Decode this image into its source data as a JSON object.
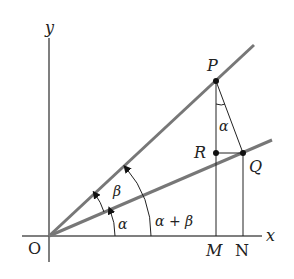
{
  "diagram": {
    "colors": {
      "axis": "#555555",
      "ray": "#777777",
      "construction": "#222222",
      "point": "#111111",
      "text": "#222222"
    },
    "axes": {
      "x_label": "x",
      "y_label": "y",
      "origin_label": "O"
    },
    "points": {
      "P": "P",
      "Q": "Q",
      "R": "R",
      "M": "M",
      "N": "N"
    },
    "angles": {
      "alpha_at_O": "α",
      "beta_at_O": "β",
      "sum_at_O": "α + β",
      "alpha_at_P": "α"
    }
  }
}
